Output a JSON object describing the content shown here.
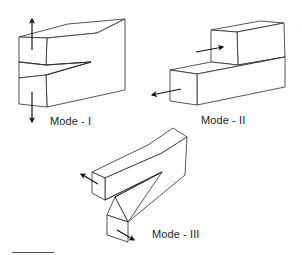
{
  "figure": {
    "panels": [
      {
        "id": "mode-1",
        "label": "Mode - I",
        "description": "Opening mode: crack faces pulled apart perpendicular to crack plane",
        "arrows": [
          "up",
          "down"
        ]
      },
      {
        "id": "mode-2",
        "label": "Mode - II",
        "description": "Sliding mode: in-plane shear, faces slide along crack direction",
        "arrows": [
          "right",
          "left"
        ]
      },
      {
        "id": "mode-3",
        "label": "Mode - III",
        "description": "Tearing mode: out-of-plane shear",
        "arrows": [
          "up-left",
          "down-right"
        ]
      }
    ],
    "colors": {
      "line": "#2a2a2a",
      "arrow": "#111111",
      "background": "#ffffff"
    }
  }
}
